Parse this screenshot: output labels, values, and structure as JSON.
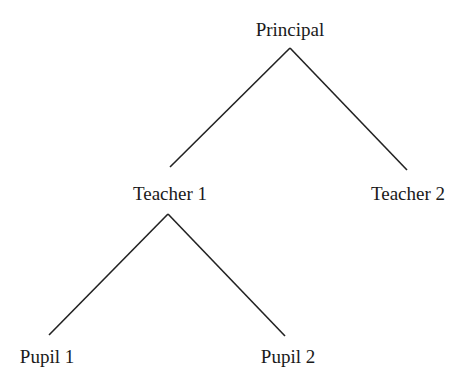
{
  "diagram": {
    "type": "tree",
    "nodes": [
      {
        "id": "principal",
        "label": "Principal",
        "x": 290,
        "y": 20
      },
      {
        "id": "teacher1",
        "label": "Teacher 1",
        "x": 170,
        "y": 184
      },
      {
        "id": "teacher2",
        "label": "Teacher 2",
        "x": 408,
        "y": 184
      },
      {
        "id": "pupil1",
        "label": "Pupil 1",
        "x": 47,
        "y": 347
      },
      {
        "id": "pupil2",
        "label": "Pupil 2",
        "x": 288,
        "y": 347
      }
    ],
    "edges": [
      {
        "from": "principal",
        "to": "teacher1"
      },
      {
        "from": "principal",
        "to": "teacher2"
      },
      {
        "from": "teacher1",
        "to": "pupil1"
      },
      {
        "from": "teacher1",
        "to": "pupil2"
      }
    ],
    "line_color": "#222222"
  }
}
